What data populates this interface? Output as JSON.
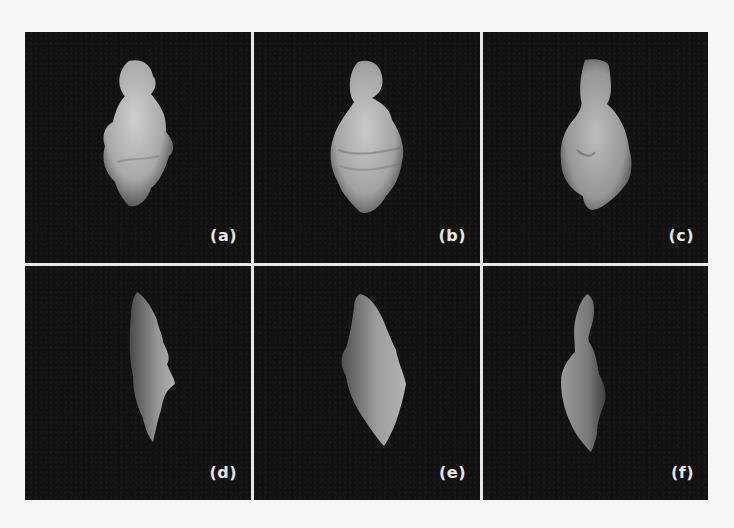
{
  "figure": {
    "layout": {
      "rows": 2,
      "columns": 3
    },
    "background_color": "#111111",
    "divider_color": "#e8e8e8",
    "label_color": "#e6e6e6",
    "panels": [
      {
        "label": "(a)",
        "view": "front",
        "shape": "vertebra-front-a",
        "fill": "#bdbdbd"
      },
      {
        "label": "(b)",
        "view": "front",
        "shape": "vertebra-front-b",
        "fill": "#b8b8b8"
      },
      {
        "label": "(c)",
        "view": "front",
        "shape": "vertebra-front-c",
        "fill": "#a9a9a9"
      },
      {
        "label": "(d)",
        "view": "side",
        "shape": "vertebra-side-d",
        "fill": "#8f8f8f"
      },
      {
        "label": "(e)",
        "view": "side",
        "shape": "vertebra-side-e",
        "fill": "#9a9a9a"
      },
      {
        "label": "(f)",
        "view": "side",
        "shape": "vertebra-side-f",
        "fill": "#8a8a8a"
      }
    ]
  }
}
